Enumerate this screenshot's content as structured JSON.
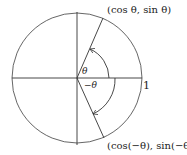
{
  "diagram": {
    "type": "unit-circle",
    "labels": {
      "upper_point": "(cos θ, sin θ)",
      "lower_point": "(cos(−θ), sin(−θ))",
      "angle_pos": "θ",
      "angle_neg": "−θ",
      "radius": "1"
    },
    "colors": {
      "stroke": "#333333",
      "background": "#ffffff"
    }
  }
}
